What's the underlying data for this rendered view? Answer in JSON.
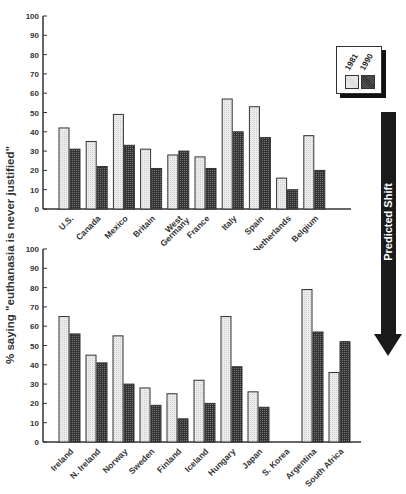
{
  "chart_data": [
    {
      "type": "bar",
      "title": "",
      "xlabel": "",
      "ylabel": "% saying \"euthanasia is never justified\"",
      "ylim": [
        0,
        100
      ],
      "yticks": [
        0,
        10,
        20,
        30,
        40,
        50,
        60,
        70,
        80,
        90,
        100
      ],
      "categories": [
        "U.S.",
        "Canada",
        "Mexico",
        "Britain",
        "West Germany",
        "France",
        "Italy",
        "Spain",
        "Netherlands",
        "Belgium"
      ],
      "series": [
        {
          "name": "1981",
          "values": [
            42,
            35,
            49,
            31,
            28,
            27,
            57,
            53,
            16,
            38
          ]
        },
        {
          "name": "1990",
          "values": [
            31,
            22,
            33,
            21,
            30,
            21,
            40,
            37,
            10,
            20
          ]
        }
      ],
      "grid": false,
      "legend_position": "right"
    },
    {
      "type": "bar",
      "title": "",
      "xlabel": "",
      "ylabel": "% saying \"euthanasia is never justified\"",
      "ylim": [
        0,
        100
      ],
      "yticks": [
        0,
        10,
        20,
        30,
        40,
        50,
        60,
        70,
        80,
        90,
        100
      ],
      "categories": [
        "Ireland",
        "N. Ireland",
        "Norway",
        "Sweden",
        "Finland",
        "Iceland",
        "Hungary",
        "Japan",
        "S. Korea",
        "Argentina",
        "South Africa"
      ],
      "series": [
        {
          "name": "1981",
          "values": [
            65,
            45,
            55,
            28,
            25,
            32,
            65,
            26,
            null,
            79,
            36
          ]
        },
        {
          "name": "1990",
          "values": [
            56,
            41,
            30,
            19,
            12,
            20,
            39,
            18,
            null,
            57,
            52
          ]
        }
      ],
      "grid": false,
      "legend_position": "right"
    }
  ],
  "labels": {
    "ylabel": "% saying \"euthanasia is never justified\"",
    "legend_1981": "1981",
    "legend_1990": "1990",
    "arrow": "Predicted Shift"
  },
  "colors": {
    "series_1981": "#e6e6e6",
    "series_1990": "#4a4a4a",
    "arrow": "#1a1a1a"
  }
}
